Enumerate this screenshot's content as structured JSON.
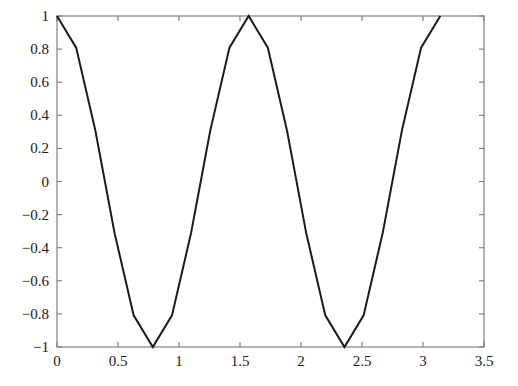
{
  "chart_data": {
    "type": "line",
    "title": "",
    "xlabel": "",
    "ylabel": "",
    "xlim": [
      0,
      3.5
    ],
    "ylim": [
      -1,
      1
    ],
    "grid": false,
    "legend": null,
    "legend_position": "none",
    "xticks": [
      0,
      0.5,
      1,
      1.5,
      2,
      2.5,
      3,
      3.5
    ],
    "xticklabels": [
      "0",
      "0.5",
      "1",
      "1.5",
      "2",
      "2.5",
      "3",
      "3.5"
    ],
    "yticks": [
      -1,
      -0.8,
      -0.6,
      -0.4,
      -0.2,
      0,
      0.2,
      0.4,
      0.6,
      0.8,
      1
    ],
    "yticklabels": [
      "−1",
      "−0.8",
      "−0.6",
      "−0.4",
      "−0.2",
      "0",
      "0.2",
      "0.4",
      "0.6",
      "0.8",
      "1"
    ],
    "series": [
      {
        "name": "cos(4x)",
        "color": "#1a1a1a",
        "linewidth": 2,
        "marker": "none",
        "x": [
          0,
          0.1571,
          0.3142,
          0.4712,
          0.6283,
          0.7854,
          0.9425,
          1.0996,
          1.2566,
          1.4137,
          1.5708,
          1.7279,
          1.885,
          2.042,
          2.1991,
          2.3562,
          2.5133,
          2.6704,
          2.8274,
          2.9845,
          3.1416
        ],
        "y": [
          1,
          0.809,
          0.309,
          -0.309,
          -0.809,
          -1,
          -0.809,
          -0.309,
          0.309,
          0.809,
          1,
          0.809,
          0.309,
          -0.309,
          -0.809,
          -1,
          -0.809,
          -0.309,
          0.309,
          0.809,
          1
        ]
      }
    ],
    "annotations": [],
    "axes_color": "#808080",
    "background": "#ffffff"
  },
  "figure": {
    "window_title": "",
    "axis_box": {
      "left": 57,
      "right": 484,
      "top": 16,
      "bottom": 347
    }
  }
}
